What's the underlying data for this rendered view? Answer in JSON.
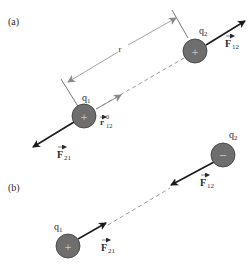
{
  "panels": [
    {
      "label": "(a)",
      "distance_label": "r",
      "charges": [
        {
          "name": "q",
          "sub": "1",
          "sign": "+"
        },
        {
          "name": "q",
          "sub": "2",
          "sign": "+"
        }
      ],
      "forces": [
        {
          "name": "F",
          "sub": "21"
        },
        {
          "name": "F",
          "sub": "12"
        }
      ],
      "unit_vector": {
        "name": "r",
        "sup": "0",
        "sub": "12"
      }
    },
    {
      "label": "(b)",
      "charges": [
        {
          "name": "q",
          "sub": "1",
          "sign": "+"
        },
        {
          "name": "q",
          "sub": "2",
          "sign": "−"
        }
      ],
      "forces": [
        {
          "name": "F",
          "sub": "21"
        },
        {
          "name": "F",
          "sub": "12"
        }
      ]
    }
  ],
  "colors": {
    "charge_fill": "#6e6e6e",
    "charge_stroke": "#3a3a3a",
    "arrow": "#1a1a1a",
    "dim_line": "#8a8a8a"
  }
}
